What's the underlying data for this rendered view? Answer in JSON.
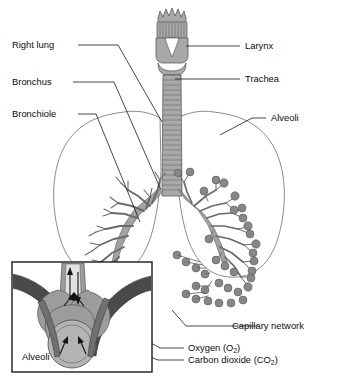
{
  "figure": {
    "background_color": "#ffffff",
    "line_color": "#1a1a1a",
    "organ_fill_color": "#a9a9a9",
    "alveoli_color": "#878787",
    "capillary_color": "#4a4a4a"
  },
  "labels": {
    "right_lung": "Right lung",
    "bronchus": "Bronchus",
    "bronchiole": "Bronchiole",
    "larynx": "Larynx",
    "trachea": "Trachea",
    "alveoli": "Alveoli",
    "capillary_network": "Capillary network",
    "oxygen": "Oxygen (O",
    "oxygen_sub": "2",
    "oxygen_end": ")",
    "carbon_dioxide": "Carbon dioxide (CO",
    "carbon_dioxide_sub": "2",
    "carbon_dioxide_end": ")",
    "inset_alveoli": "Alveoli"
  }
}
